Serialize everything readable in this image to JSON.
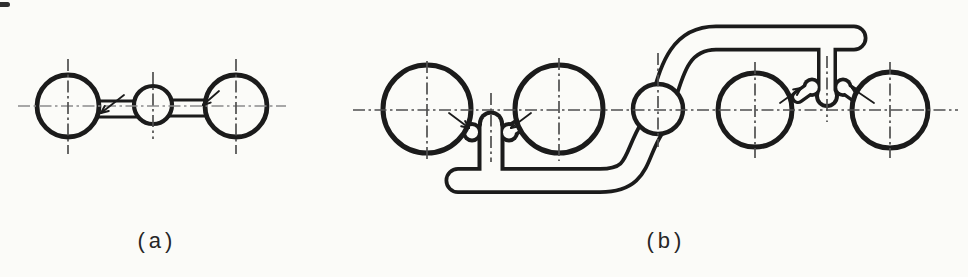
{
  "figure": {
    "background": "#fbfbf8",
    "ink": "#1b1b1b",
    "paper": "#fbfbf8",
    "centerline_color": "#4f4f4f",
    "centerline_light_color": "#8c8c8c",
    "arrow_color": "#1b1b1b"
  },
  "panels": {
    "a": {
      "label": "(a)",
      "pads": [
        {
          "cx": 68,
          "cy": 106,
          "r": 31,
          "sw": 4.8
        },
        {
          "cx": 153,
          "cy": 105,
          "r": 19,
          "sw": 4.2
        },
        {
          "cx": 236,
          "cy": 106,
          "r": 31,
          "sw": 4.8
        }
      ],
      "traces": [
        {
          "d": "M 92 109 L 138 109",
          "outer": 19,
          "inner": 13
        },
        {
          "d": "M 167 108 L 212 108",
          "outer": 19,
          "inner": 13
        }
      ],
      "centerlines": [
        {
          "x1": 18,
          "y1": 106,
          "x2": 286,
          "y2": 106,
          "light": true
        },
        {
          "x1": 68,
          "y1": 59,
          "x2": 68,
          "y2": 154
        },
        {
          "x1": 153,
          "y1": 72,
          "x2": 153,
          "y2": 139
        },
        {
          "x1": 236,
          "y1": 59,
          "x2": 236,
          "y2": 154
        }
      ],
      "arrows": [
        {
          "tail": [
            124,
            95
          ],
          "tip": [
            101,
            113
          ]
        },
        {
          "tail": [
            219,
            91
          ],
          "tip": [
            203,
            105
          ]
        }
      ]
    },
    "b": {
      "label": "(b)",
      "pads": [
        {
          "cx": 427,
          "cy": 109,
          "r": 44,
          "sw": 5
        },
        {
          "cx": 559,
          "cy": 109,
          "r": 44,
          "sw": 5
        },
        {
          "cx": 658,
          "cy": 109,
          "r": 25,
          "sw": 4.5
        },
        {
          "cx": 755,
          "cy": 110,
          "r": 37,
          "sw": 5
        },
        {
          "cx": 890,
          "cy": 110,
          "r": 38,
          "sw": 5
        }
      ],
      "traces": [
        {
          "d": "M 458 180.5 L 600 180.5 C 640 180.5 634 156 652 128 C 670 100 666 38 716 38 L 854 38",
          "outer": 27,
          "inner": 19.5
        },
        {
          "d": "M 491 127 L 491 176",
          "outer": 27,
          "inner": 19
        },
        {
          "d": "M 491 123.5 L 491 124",
          "outer": 26,
          "inner": 18
        },
        {
          "d": "M 472 132 L 472 132.5",
          "outer": 20,
          "inner": 12
        },
        {
          "d": "M 509 132 L 509 132.5",
          "outer": 20,
          "inner": 12
        },
        {
          "d": "M 472 132 L 458 123",
          "outer": 15,
          "inner": 8
        },
        {
          "d": "M 509 132 L 523 123",
          "outer": 15,
          "inner": 8
        },
        {
          "d": "M 827 46 L 827 93",
          "outer": 20,
          "inner": 13
        },
        {
          "d": "M 827 95.5 L 827 96",
          "outer": 24,
          "inner": 16
        },
        {
          "d": "M 812 87 L 812 87.5",
          "outer": 19,
          "inner": 11.5
        },
        {
          "d": "M 843 87 L 843 87.5",
          "outer": 19,
          "inner": 11.5
        },
        {
          "d": "M 812 87 L 798 97",
          "outer": 14,
          "inner": 7.5
        },
        {
          "d": "M 843 87 L 857 97",
          "outer": 14,
          "inner": 7.5
        }
      ],
      "centerlines": [
        {
          "x1": 353,
          "y1": 110,
          "x2": 958,
          "y2": 110
        },
        {
          "x1": 427,
          "y1": 61,
          "x2": 427,
          "y2": 161
        },
        {
          "x1": 559,
          "y1": 58,
          "x2": 559,
          "y2": 161
        },
        {
          "x1": 658,
          "y1": 53,
          "x2": 658,
          "y2": 147
        },
        {
          "x1": 755,
          "y1": 62,
          "x2": 755,
          "y2": 158
        },
        {
          "x1": 890,
          "y1": 62,
          "x2": 890,
          "y2": 158
        },
        {
          "x1": 491,
          "y1": 93,
          "x2": 491,
          "y2": 162
        },
        {
          "x1": 827,
          "y1": 56,
          "x2": 827,
          "y2": 122
        }
      ],
      "arrows": [
        {
          "tail": [
            449,
            113
          ],
          "tip": [
            469,
            128
          ]
        },
        {
          "tail": [
            531,
            113
          ],
          "tip": [
            511,
            128
          ]
        },
        {
          "tail": [
            780,
            103
          ],
          "tip": [
            801,
            88
          ]
        },
        {
          "tail": [
            874,
            103
          ],
          "tip": [
            852,
            88
          ]
        }
      ]
    }
  }
}
